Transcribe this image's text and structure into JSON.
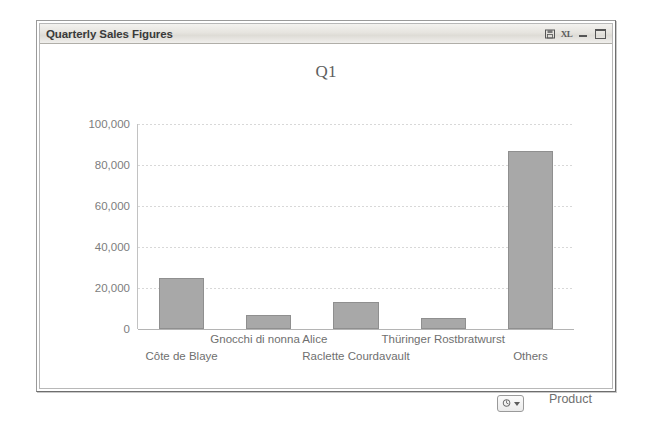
{
  "window": {
    "title": "Quarterly Sales Figures",
    "controls": [
      {
        "name": "print-preview-icon",
        "label": ""
      },
      {
        "name": "export-excel-icon",
        "label": "XL"
      },
      {
        "name": "minimize-button",
        "label": ""
      },
      {
        "name": "maximize-button",
        "label": ""
      }
    ]
  },
  "chart_data": {
    "type": "bar",
    "title": "Q1",
    "xlabel": "Product",
    "ylabel": "",
    "categories": [
      "Côte de Blaye",
      "Gnocchi di nonna Alice",
      "Raclette Courdavault",
      "Thüringer Rostbratwurst",
      "Others"
    ],
    "values": [
      24900,
      6800,
      13000,
      5400,
      87000
    ],
    "ylim": [
      0,
      100000
    ],
    "yticks": [
      0,
      20000,
      40000,
      60000,
      80000,
      100000
    ],
    "ytick_labels": [
      "0",
      "20,000",
      "40,000",
      "60,000",
      "80,000",
      "100,000"
    ],
    "grid": true,
    "legend": false,
    "bar_color": "#a8a8a8",
    "bar_border_color": "#8f8f8f",
    "grid_color": "#d8d8d8",
    "text_color": "#6f6f6f"
  },
  "controls": {
    "chart_tools_button": "",
    "axis_title": "Product"
  }
}
